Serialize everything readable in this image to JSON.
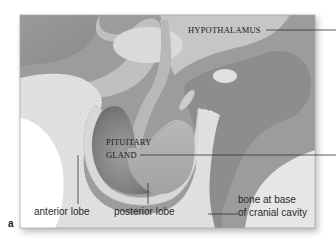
{
  "figure": {
    "panel_letter": "a",
    "labels": {
      "hypothalamus": "HYPOTHALAMUS",
      "pituitary_line1": "PITUITARY",
      "pituitary_line2": "GLAND",
      "anterior_lobe": "anterior lobe",
      "posterior_lobe": "posterior lobe",
      "bone_line1": "bone at base",
      "bone_line2": "of cranial cavity"
    },
    "colors": {
      "background": "#ffffff",
      "tissue_dark": "#8f8f8f",
      "tissue_mid": "#a8a8a8",
      "tissue_light": "#c9c9c9",
      "bone": "#e4e4e4",
      "membrane": "#d6d6d6",
      "leader_line": "#333333"
    }
  }
}
